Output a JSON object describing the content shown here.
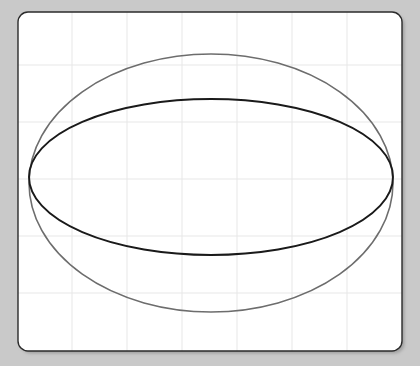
{
  "canvas": {
    "width": 420,
    "height": 366,
    "background_color": "#c9c9c9"
  },
  "card": {
    "name": "plot-card",
    "x": 18,
    "y": 12,
    "width": 384,
    "height": 339,
    "corner_radius": 10,
    "fill_color": "#ffffff",
    "border_color": "#2b2b2b",
    "border_width": 1.4,
    "shadow_color": "#a8a8a8"
  },
  "chart_data": {
    "type": "line",
    "title": "",
    "subtitle": "",
    "xlabel": "",
    "ylabel": "",
    "grid": true,
    "legend_position": "none",
    "xlim": [
      0,
      420
    ],
    "ylim": [
      0,
      366
    ],
    "xticks": [
      72,
      127,
      182,
      237,
      292,
      347
    ],
    "yticks": [
      65,
      122,
      179,
      236,
      293
    ],
    "xtick_labels": [
      "",
      "",
      "",
      "",
      "",
      ""
    ],
    "ytick_labels": [
      "",
      "",
      "",
      "",
      ""
    ],
    "grid_color": "#e7e7e7",
    "grid_width": 1,
    "annotations": [],
    "series": [
      {
        "name": "outer-ellipse",
        "shape": "ellipse",
        "center_x": 211,
        "center_y": 183,
        "radius_x": 182,
        "radius_y": 129,
        "color": "#6d6d6d",
        "stroke_width": 1.6,
        "fill": "none"
      },
      {
        "name": "inner-ellipse",
        "shape": "ellipse",
        "center_x": 211,
        "center_y": 177,
        "radius_x": 182,
        "radius_y": 78,
        "color": "#1a1a1a",
        "stroke_width": 1.9,
        "fill": "none"
      }
    ]
  }
}
